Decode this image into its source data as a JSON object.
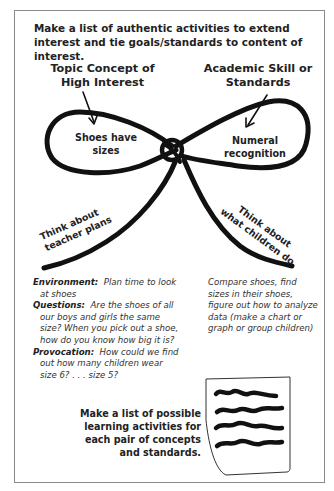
{
  "title": "Make a list of authentic activities to extend interest and tie goals/standards to content of interest.",
  "bow": {
    "left_label": "Topic Concept of High Interest",
    "right_label": "Academic Skill or Standards",
    "left_loop_text": "Shoes have sizes",
    "right_loop_text": "Numeral recognition",
    "left_tail_line1": "Think about",
    "left_tail_line2": "teacher plans",
    "right_tail_line1": "Think about",
    "right_tail_line2": "what children do"
  },
  "notes_left": [
    {
      "label": "Environment:",
      "text": "Plan time to look at shoes"
    },
    {
      "label": "Questions:",
      "text": "Are the shoes of all our boys and girls the same size? When you pick out a shoe, how do you know how big it is?"
    },
    {
      "label": "Provocation:",
      "text": "How could we find out how many children wear size 6? . . . size 5?"
    }
  ],
  "notes_right": "Compare shoes, find sizes in their shoes, figure out how to analyze data (make a chart or graph or group children)",
  "bottom_text": "Make a list of possible learning activities for each pair of concepts and standards.",
  "icons": {
    "paper": "list-paper-icon",
    "arrow": "arrow-icon",
    "ribbon": "bow-ribbon"
  }
}
